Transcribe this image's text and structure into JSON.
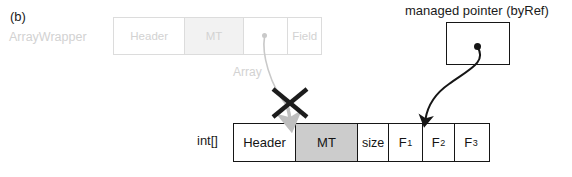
{
  "figure": {
    "panel_label": "(b)"
  },
  "wrapper_object": {
    "type_label": "ArrayWrapper",
    "cells": [
      {
        "label": "Header",
        "shaded": false
      },
      {
        "label": "MT",
        "shaded": true
      },
      {
        "label": "",
        "shaded": false
      },
      {
        "label": "Field",
        "shaded": false
      }
    ],
    "field_annotation": "Array",
    "style_note": "faded"
  },
  "managed_pointer": {
    "label": "managed pointer (byRef)",
    "cells": [
      {
        "label": ""
      }
    ]
  },
  "array_object": {
    "type_label": "int[]",
    "cells": [
      {
        "label": "Header",
        "sub": "",
        "shaded": false
      },
      {
        "label": "MT",
        "sub": "",
        "shaded": true
      },
      {
        "label": "size",
        "sub": "",
        "shaded": false
      },
      {
        "label": "F",
        "sub": "1",
        "shaded": false
      },
      {
        "label": "F",
        "sub": "2",
        "shaded": false
      },
      {
        "label": "F",
        "sub": "3",
        "shaded": false
      }
    ]
  },
  "annotations": {
    "invalidated_reference_marker": "X",
    "gray_arrow_meaning": "ArrayWrapper.Array -> int[] object header/MT boundary (crossed out)",
    "black_arrow_meaning": "managed pointer (byRef) -> interior element boundary F1/F2"
  },
  "colors": {
    "ink": "#161616",
    "ghost": "#d2d2d2",
    "mt_shade_array": "#cccccc",
    "mt_shade_wrapper": "#f2f2f2",
    "gray_arrow": "#bfbfbf"
  }
}
